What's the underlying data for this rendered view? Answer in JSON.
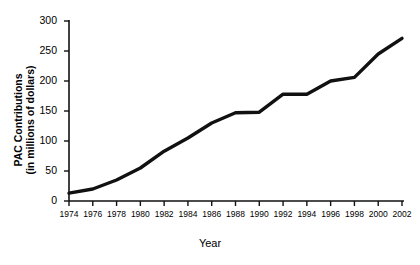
{
  "chart_data": {
    "type": "line",
    "title": "",
    "subtitle": "",
    "xlabel": "Year",
    "ylabel": "PAC Contributions (in millions of dollars)",
    "ylabel_line1": "PAC Contributions",
    "ylabel_line2": "(in millions of dollars)",
    "categories": [
      "1974",
      "1976",
      "1978",
      "1980",
      "1982",
      "1984",
      "1986",
      "1988",
      "1990",
      "1992",
      "1994",
      "1996",
      "1998",
      "2000",
      "2002"
    ],
    "x": [
      1974,
      1976,
      1978,
      1980,
      1982,
      1984,
      1986,
      1988,
      1990,
      1992,
      1994,
      1996,
      1998,
      2000,
      2002
    ],
    "values": [
      13,
      20,
      35,
      55,
      83,
      105,
      130,
      147,
      148,
      178,
      178,
      200,
      206,
      245,
      271
    ],
    "series": [
      {
        "name": "PAC Contributions",
        "values": [
          13,
          20,
          35,
          55,
          83,
          105,
          130,
          147,
          148,
          178,
          178,
          200,
          206,
          245,
          271
        ]
      }
    ],
    "ytick_labels": [
      "0",
      "50",
      "100",
      "150",
      "200",
      "250",
      "300"
    ],
    "ytick_values": [
      0,
      50,
      100,
      150,
      200,
      250,
      300
    ],
    "xtick_labels": [
      "1974",
      "1976",
      "1978",
      "1980",
      "1982",
      "1984",
      "1986",
      "1988",
      "1990",
      "1992",
      "1994",
      "1996",
      "1998",
      "2000",
      "2002"
    ],
    "ylim": [
      0,
      300
    ],
    "xlim": [
      1974,
      2002
    ],
    "grid": false,
    "legend": false,
    "legend_position": "none",
    "line_color": "#111111",
    "background_color": "#ffffff",
    "axis_color": "#111111",
    "annotations": []
  }
}
